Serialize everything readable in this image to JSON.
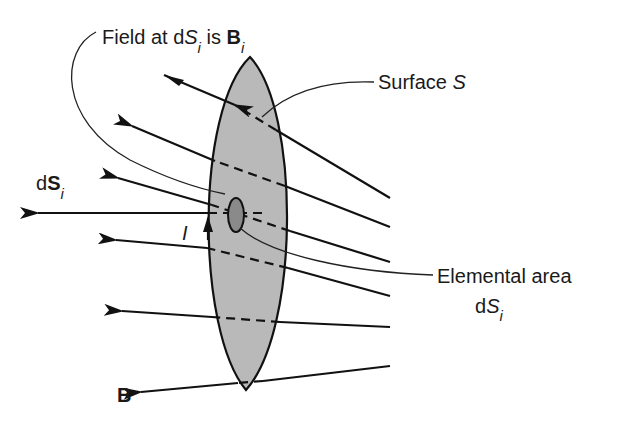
{
  "figure": {
    "type": "Diagram",
    "colors": {
      "background": "#ffffff",
      "surface_fill": "#b9b9b9",
      "element_fill": "#8a8a8a",
      "line": "#111111"
    }
  },
  "labels": {
    "field_at": {
      "prefix": "Field at d",
      "s_symbol": "S",
      "s_sub": "i",
      "mid": " is ",
      "b_symbol": "B",
      "b_sub": "i"
    },
    "surface": {
      "text": "Surface ",
      "symbol": "S"
    },
    "elemental_area": {
      "line1": "Elemental area",
      "d": "d",
      "symbol": "S",
      "sub": "i"
    },
    "normal_vector": {
      "d": "d",
      "symbol": "S",
      "sub": "i"
    },
    "current": "I",
    "field": "B"
  }
}
